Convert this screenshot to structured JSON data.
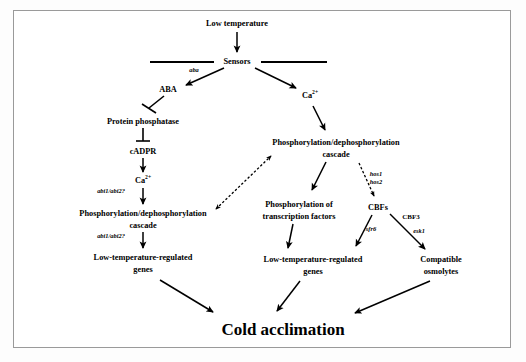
{
  "figure": {
    "title": "Cold acclimation",
    "border_color": "#9a9a9a",
    "background": "#ffffff"
  },
  "nodes": {
    "low_temperature": "Low temperature",
    "sensors": "Sensors",
    "aba": "ABA",
    "calcium_left": "Ca",
    "calcium_left_sup": "2+",
    "calcium_right": "Ca",
    "calcium_right_sup": "2+",
    "protein_phosphatase": "Protein phosphatase",
    "cadpr": "cADPR",
    "cascade_left_line1": "Phosphorylation/dephosphorylation",
    "cascade_left_line2": "cascade",
    "cascade_right_line1": "Phosphorylation/dephosphorylation",
    "cascade_right_line2": "cascade",
    "transcription_line1": "Phosphorylation of",
    "transcription_line2": "transcription factors",
    "cbfs": "CBFs",
    "genes_left_line1": "Low-temperature-regulated",
    "genes_left_line2": "genes",
    "genes_center_line1": "Low-temperature-regulated",
    "genes_center_line2": "genes",
    "osmolytes_line1": "Compatible",
    "osmolytes_line2": "osmolytes",
    "cold_acclimation": "Cold acclimation"
  },
  "edge_labels": {
    "aba_gene": "aba",
    "abi_upper": "abi1/abi2?",
    "abi_lower": "abi1/abi2?",
    "hos1": "hos1",
    "hos2": "hos2",
    "sfr6": "sfr6",
    "esk1": "esk1",
    "cbf3": "CBF3"
  }
}
